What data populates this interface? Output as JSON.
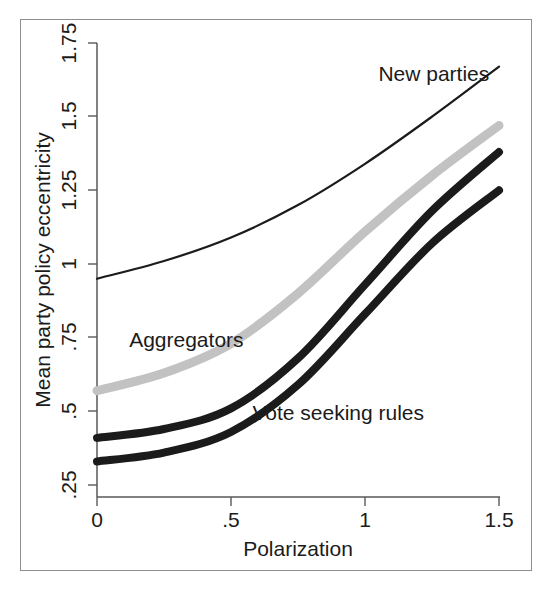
{
  "chart_data": {
    "type": "line",
    "title": "",
    "xlabel": "Polarization",
    "ylabel": "Mean party policy eccentricity",
    "xlim": [
      0,
      1.5
    ],
    "ylim": [
      0.25,
      1.75
    ],
    "grid": false,
    "legend_position": "inline-annotations",
    "x_ticks": [
      "0",
      ".5",
      "1",
      "1.5"
    ],
    "x_tick_values": [
      0,
      0.5,
      1,
      1.5
    ],
    "y_ticks": [
      ".25",
      ".5",
      ".75",
      "1",
      "1.25",
      "1.5",
      "1.75"
    ],
    "y_tick_values": [
      0.25,
      0.5,
      0.75,
      1,
      1.25,
      1.5,
      1.75
    ],
    "x": [
      0,
      0.25,
      0.5,
      0.75,
      1.0,
      1.25,
      1.5
    ],
    "series": [
      {
        "name": "New parties",
        "label": "New parties",
        "color": "#1b1b1b",
        "style": "thin-solid",
        "stroke_width": 2.2,
        "values": [
          0.95,
          1.01,
          1.09,
          1.2,
          1.34,
          1.5,
          1.67
        ],
        "label_x": 1.05,
        "label_y": 1.62
      },
      {
        "name": "Aggregators",
        "label": "Aggregators",
        "color": "#c2c2c2",
        "style": "thick-solid",
        "stroke_width": 9,
        "values": [
          0.57,
          0.63,
          0.73,
          0.9,
          1.11,
          1.3,
          1.47
        ],
        "label_x": 0.12,
        "label_y": 0.72
      },
      {
        "name": "Vote seeking rules upper",
        "label": "",
        "color": "#1b1b1b",
        "style": "thick-solid",
        "stroke_width": 8,
        "values": [
          0.41,
          0.44,
          0.51,
          0.68,
          0.93,
          1.18,
          1.38
        ],
        "label_x": null,
        "label_y": null
      },
      {
        "name": "Vote seeking rules lower",
        "label": "Vote seeking rules",
        "color": "#1b1b1b",
        "style": "thick-solid",
        "stroke_width": 8,
        "values": [
          0.33,
          0.36,
          0.43,
          0.59,
          0.83,
          1.07,
          1.25
        ],
        "label_x": 0.58,
        "label_y": 0.47
      }
    ],
    "annotations": [
      {
        "text": "New parties",
        "x": 1.05,
        "y": 1.62
      },
      {
        "text": "Aggregators",
        "x": 0.12,
        "y": 0.72
      },
      {
        "text": "Vote seeking rules",
        "x": 0.58,
        "y": 0.47
      }
    ]
  },
  "axis": {
    "y_label": "Mean party policy eccentricity",
    "x_label": "Polarization",
    "y_tick_1": ".25",
    "y_tick_2": ".5",
    "y_tick_3": ".75",
    "y_tick_4": "1",
    "y_tick_5": "1.25",
    "y_tick_6": "1.5",
    "y_tick_7": "1.75",
    "x_tick_1": "0",
    "x_tick_2": ".5",
    "x_tick_3": "1",
    "x_tick_4": "1.5"
  },
  "labels": {
    "new_parties": "New parties",
    "aggregators": "Aggregators",
    "vote_seeking_rules": "Vote seeking rules"
  },
  "colors": {
    "line_black": "#1b1b1b",
    "line_gray": "#c2c2c2",
    "axis": "#58595b",
    "frame": "#8d8d8d",
    "background": "#ffffff"
  }
}
